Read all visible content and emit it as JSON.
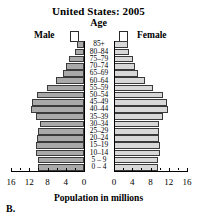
{
  "chart_data": {
    "type": "bar",
    "title": "United States: 2005",
    "subtitle": "Age",
    "xlabel": "Population in millions",
    "ylabel": "Age",
    "panel_label": "B.",
    "orientation": "population-pyramid",
    "grid": false,
    "legend_position": "top",
    "xlim": [
      0,
      16
    ],
    "xticks": [
      16,
      12,
      8,
      4,
      0
    ],
    "xticks_left": [
      "16",
      "12",
      "8",
      "4",
      "0"
    ],
    "xticks_right": [
      "0",
      "4",
      "8",
      "12",
      "16"
    ],
    "categories": [
      "85+",
      "80–84",
      "75–79",
      "70–74",
      "65–69",
      "60–64",
      "55–59",
      "50–54",
      "45–49",
      "40–44",
      "35–39",
      "30–34",
      "25–29",
      "20–24",
      "15–19",
      "10–14",
      "5 – 9",
      "0 – 4"
    ],
    "series": [
      {
        "name": "Male",
        "color": "#a9a9a9",
        "values": [
          1.6,
          2.0,
          3.2,
          4.0,
          4.7,
          6.2,
          8.1,
          10.2,
          11.3,
          11.6,
          10.5,
          9.7,
          10.0,
          10.3,
          10.6,
          10.5,
          10.0,
          10.1
        ]
      },
      {
        "name": "Female",
        "color": "#d8d8d8",
        "values": [
          3.1,
          3.2,
          4.2,
          4.7,
          5.3,
          6.7,
          8.6,
          10.7,
          11.7,
          11.9,
          10.7,
          9.8,
          9.8,
          9.9,
          10.1,
          10.0,
          9.6,
          9.7
        ]
      }
    ]
  },
  "legend": {
    "male_label": "Male",
    "female_label": "Female"
  }
}
